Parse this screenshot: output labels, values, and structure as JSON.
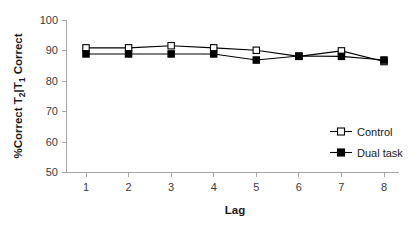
{
  "chart_data": {
    "type": "line",
    "title": "",
    "subtitle": "",
    "xlabel": "Lag",
    "ylabel": "%Correct T2|T1 Correct",
    "ylabel_parts": {
      "prefix": "%Correct T",
      "sub1": "2",
      "mid": "|T",
      "sub2": "1",
      "suffix": " Correct"
    },
    "x": [
      1,
      2,
      3,
      4,
      5,
      6,
      7,
      8
    ],
    "categories": [
      "1",
      "2",
      "3",
      "4",
      "5",
      "6",
      "7",
      "8"
    ],
    "xtick_labels": [
      "1",
      "2",
      "3",
      "4",
      "5",
      "6",
      "7",
      "8"
    ],
    "ytick_labels": [
      "50",
      "60",
      "70",
      "80",
      "90",
      "100"
    ],
    "yticks": [
      50,
      60,
      70,
      80,
      90,
      100
    ],
    "xlim": [
      0.5,
      8.5
    ],
    "ylim": [
      50,
      100
    ],
    "grid": false,
    "legend_position": "right-middle",
    "series": [
      {
        "name": "Control",
        "marker": "open-square",
        "values": [
          91.0,
          91.0,
          91.7,
          91.0,
          90.2,
          88.2,
          90.0,
          86.5
        ]
      },
      {
        "name": "Dual task",
        "marker": "filled-square",
        "values": [
          89.0,
          89.0,
          89.0,
          89.0,
          87.0,
          88.3,
          88.2,
          87.0
        ]
      }
    ]
  },
  "legend": {
    "entries": [
      {
        "label": "Control"
      },
      {
        "label": "Dual task"
      }
    ]
  },
  "colors": {
    "background": "#ffffff",
    "axis": "#a6a6a6",
    "data": "#000000",
    "tick_text": "#3b3b3b"
  }
}
